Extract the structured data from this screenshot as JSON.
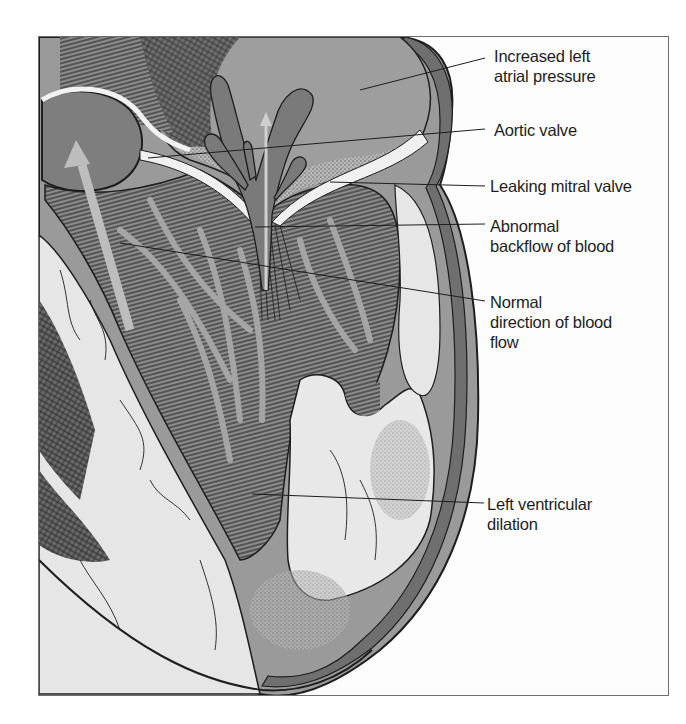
{
  "figure": {
    "frame": {
      "border_color": "#6e6e6e",
      "background": "#fdfdfd"
    },
    "colors": {
      "ink": "#1e1e1e",
      "dark_tissue": "#4a4a4a",
      "mid_tissue": "#8c8c8c",
      "light_tissue": "#d8d8d8",
      "pale_muscle": "#e6e6e6",
      "blood_flow": "#7a7a7a",
      "arrow": "#bdbdbd"
    }
  },
  "labels": [
    {
      "id": "increased-left-atrial-pressure",
      "lines": [
        "Increased left",
        "atrial pressure"
      ],
      "x": 494,
      "y": 46,
      "leader": {
        "from": [
          485,
          58
        ],
        "to": [
          360,
          90
        ]
      }
    },
    {
      "id": "aortic-valve",
      "lines": [
        "Aortic valve"
      ],
      "x": 494,
      "y": 120,
      "leader": {
        "from": [
          485,
          129
        ],
        "to": [
          148,
          158
        ]
      }
    },
    {
      "id": "leaking-mitral-valve",
      "lines": [
        "Leaking mitral valve"
      ],
      "x": 490,
      "y": 176,
      "leader": {
        "from": [
          485,
          186
        ],
        "to": [
          330,
          182
        ]
      }
    },
    {
      "id": "abnormal-backflow-of-blood",
      "lines": [
        "Abnormal",
        "backflow of blood"
      ],
      "x": 490,
      "y": 216,
      "leader": {
        "from": [
          485,
          224
        ],
        "to": [
          255,
          227
        ]
      }
    },
    {
      "id": "normal-direction-of-blood-flow",
      "lines": [
        "Normal",
        "direction of blood",
        "flow"
      ],
      "x": 490,
      "y": 298,
      "leader": {
        "from": [
          485,
          301
        ],
        "to": [
          120,
          243
        ]
      }
    },
    {
      "id": "left-ventricular-dilation",
      "lines": [
        "Left ventricular",
        "dilation"
      ],
      "x": 487,
      "y": 495,
      "leader": {
        "from": [
          484,
          503
        ],
        "to": [
          252,
          494
        ]
      }
    }
  ]
}
